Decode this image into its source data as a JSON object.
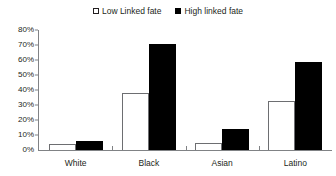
{
  "chart_data": {
    "type": "bar",
    "title": "",
    "xlabel": "",
    "ylabel": "",
    "categories": [
      "White",
      "Black",
      "Asian",
      "Latino"
    ],
    "series": [
      {
        "name": "Low Linked fate",
        "values": [
          4,
          38,
          5,
          33
        ],
        "color": "#ffffff"
      },
      {
        "name": "High linked fate",
        "values": [
          6,
          71,
          14,
          59
        ],
        "color": "#000000"
      }
    ],
    "ylim": [
      0,
      80
    ],
    "ytick_values": [
      0,
      10,
      20,
      30,
      40,
      50,
      60,
      70,
      80
    ],
    "ytick_labels": [
      "0%",
      "10%",
      "20%",
      "30%",
      "40%",
      "50%",
      "60%",
      "70%",
      "80%"
    ],
    "grid": false,
    "legend_position": "top-center",
    "value_format": "percent"
  },
  "legend": {
    "entries": [
      {
        "label": "Low Linked fate",
        "swatch": "open-square-swatch"
      },
      {
        "label": "High linked fate",
        "swatch": "filled-square-swatch"
      }
    ]
  }
}
